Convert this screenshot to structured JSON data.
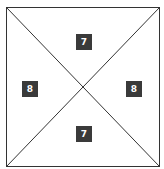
{
  "diagram": {
    "shape": "square divided by two diagonals into four triangles",
    "colors": {
      "line": "#333333",
      "label_bg": "#3a3a3a",
      "label_text": "#ffffff",
      "background": "#ffffff"
    },
    "regions": [
      {
        "position": "top",
        "label": "7"
      },
      {
        "position": "left",
        "label": "8"
      },
      {
        "position": "right",
        "label": "8"
      },
      {
        "position": "bottom",
        "label": "7"
      }
    ]
  }
}
